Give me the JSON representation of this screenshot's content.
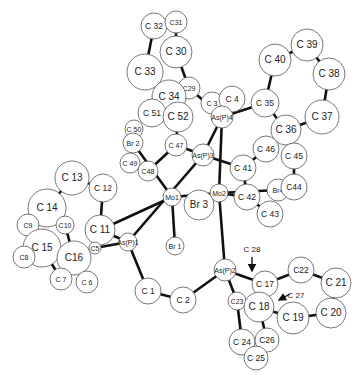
{
  "figure": {
    "type": "ORTEP molecular structure",
    "background": "#ffffff",
    "line_color": "#111111"
  },
  "atoms": [
    {
      "id": "C32",
      "label": "C 32",
      "x": 154,
      "y": 26,
      "r": 13
    },
    {
      "id": "C31",
      "label": "C31",
      "x": 176,
      "y": 22,
      "r": 11
    },
    {
      "id": "C30",
      "label": "C 30",
      "x": 176,
      "y": 52,
      "r": 16
    },
    {
      "id": "C33",
      "label": "C 33",
      "x": 145,
      "y": 72,
      "r": 18
    },
    {
      "id": "C29",
      "label": "C29",
      "x": 189,
      "y": 88,
      "r": 11
    },
    {
      "id": "C34",
      "label": "C 34",
      "x": 169,
      "y": 97,
      "r": 17
    },
    {
      "id": "C51",
      "label": "C 51",
      "x": 152,
      "y": 113,
      "r": 14
    },
    {
      "id": "C52",
      "label": "C 52",
      "x": 178,
      "y": 117,
      "r": 15
    },
    {
      "id": "C3",
      "label": "C 3",
      "x": 212,
      "y": 103,
      "r": 11
    },
    {
      "id": "C4",
      "label": "C 4",
      "x": 232,
      "y": 99,
      "r": 13
    },
    {
      "id": "AsP4",
      "label": "As(P)4",
      "x": 222,
      "y": 117,
      "r": 11
    },
    {
      "id": "C35",
      "label": "C 35",
      "x": 265,
      "y": 103,
      "r": 14
    },
    {
      "id": "C40",
      "label": "C 40",
      "x": 275,
      "y": 60,
      "r": 16
    },
    {
      "id": "C39",
      "label": "C 39",
      "x": 307,
      "y": 45,
      "r": 16
    },
    {
      "id": "C38",
      "label": "C 38",
      "x": 329,
      "y": 74,
      "r": 16
    },
    {
      "id": "C37",
      "label": "C 37",
      "x": 322,
      "y": 117,
      "r": 17
    },
    {
      "id": "C36",
      "label": "C 36",
      "x": 286,
      "y": 130,
      "r": 15
    },
    {
      "id": "C50",
      "label": "C 50",
      "x": 134,
      "y": 129,
      "r": 9
    },
    {
      "id": "Br2",
      "label": "Br 2",
      "x": 133,
      "y": 143,
      "r": 10
    },
    {
      "id": "C47",
      "label": "C 47",
      "x": 176,
      "y": 145,
      "r": 11
    },
    {
      "id": "AsP3",
      "label": "As(P)3",
      "x": 203,
      "y": 155,
      "r": 11
    },
    {
      "id": "C46",
      "label": "C 46",
      "x": 266,
      "y": 149,
      "r": 13
    },
    {
      "id": "C45",
      "label": "C 45",
      "x": 294,
      "y": 156,
      "r": 13
    },
    {
      "id": "C41",
      "label": "C 41",
      "x": 243,
      "y": 168,
      "r": 13
    },
    {
      "id": "C49",
      "label": "C 49",
      "x": 130,
      "y": 163,
      "r": 10
    },
    {
      "id": "C48",
      "label": "C48",
      "x": 148,
      "y": 171,
      "r": 10
    },
    {
      "id": "Mo1",
      "label": "Mo1",
      "x": 172,
      "y": 197,
      "r": 9
    },
    {
      "id": "Mo2",
      "label": "Mo2",
      "x": 219,
      "y": 193,
      "r": 9
    },
    {
      "id": "Br3",
      "label": "Br 3",
      "x": 199,
      "y": 205,
      "r": 15
    },
    {
      "id": "C42",
      "label": "C 42",
      "x": 247,
      "y": 197,
      "r": 13
    },
    {
      "id": "Br4",
      "label": "Br4",
      "x": 278,
      "y": 190,
      "r": 11
    },
    {
      "id": "C44",
      "label": "C44",
      "x": 294,
      "y": 187,
      "r": 13
    },
    {
      "id": "C43",
      "label": "C 43",
      "x": 270,
      "y": 214,
      "r": 13
    },
    {
      "id": "C13",
      "label": "C 13",
      "x": 72,
      "y": 178,
      "r": 17
    },
    {
      "id": "C12",
      "label": "C 12",
      "x": 103,
      "y": 188,
      "r": 14
    },
    {
      "id": "C14",
      "label": "C 14",
      "x": 47,
      "y": 208,
      "r": 19
    },
    {
      "id": "C9",
      "label": "C9",
      "x": 28,
      "y": 225,
      "r": 11
    },
    {
      "id": "C10",
      "label": "C10",
      "x": 65,
      "y": 225,
      "r": 9
    },
    {
      "id": "C11",
      "label": "C 11",
      "x": 100,
      "y": 230,
      "r": 15
    },
    {
      "id": "C15",
      "label": "C 15",
      "x": 42,
      "y": 248,
      "r": 19
    },
    {
      "id": "C5",
      "label": "C5",
      "x": 95,
      "y": 248,
      "r": 6
    },
    {
      "id": "AsP1",
      "label": "As(P)1",
      "x": 128,
      "y": 242,
      "r": 9
    },
    {
      "id": "C8",
      "label": "C8",
      "x": 24,
      "y": 257,
      "r": 11
    },
    {
      "id": "C16",
      "label": "C16",
      "x": 74,
      "y": 258,
      "r": 17
    },
    {
      "id": "C7",
      "label": "C 7",
      "x": 61,
      "y": 279,
      "r": 11
    },
    {
      "id": "C6",
      "label": "C 6",
      "x": 87,
      "y": 282,
      "r": 11
    },
    {
      "id": "Br1",
      "label": "Br 1",
      "x": 175,
      "y": 246,
      "r": 9
    },
    {
      "id": "C1",
      "label": "C 1",
      "x": 148,
      "y": 291,
      "r": 13
    },
    {
      "id": "C2",
      "label": "C 2",
      "x": 183,
      "y": 300,
      "r": 13
    },
    {
      "id": "AsP2",
      "label": "As(P)2",
      "x": 225,
      "y": 270,
      "r": 11
    },
    {
      "id": "C17",
      "label": "C 17",
      "x": 265,
      "y": 284,
      "r": 13
    },
    {
      "id": "C22",
      "label": "C22",
      "x": 301,
      "y": 270,
      "r": 13
    },
    {
      "id": "C21",
      "label": "C 21",
      "x": 336,
      "y": 283,
      "r": 15
    },
    {
      "id": "C23",
      "label": "C23",
      "x": 237,
      "y": 301,
      "r": 9
    },
    {
      "id": "C18",
      "label": "C 18",
      "x": 259,
      "y": 307,
      "r": 15
    },
    {
      "id": "C19",
      "label": "C 19",
      "x": 293,
      "y": 318,
      "r": 16
    },
    {
      "id": "C20",
      "label": "C 20",
      "x": 331,
      "y": 313,
      "r": 15
    },
    {
      "id": "C24",
      "label": "C 24",
      "x": 242,
      "y": 342,
      "r": 13
    },
    {
      "id": "C26",
      "label": "C26",
      "x": 267,
      "y": 340,
      "r": 12
    },
    {
      "id": "C25",
      "label": "C 25",
      "x": 256,
      "y": 358,
      "r": 12
    }
  ],
  "bonds": [
    [
      "C31",
      "C30"
    ],
    [
      "C32",
      "C33"
    ],
    [
      "C30",
      "C29"
    ],
    [
      "C33",
      "C34"
    ],
    [
      "C29",
      "C34"
    ],
    [
      "C29",
      "AsP4"
    ],
    [
      "C34",
      "C52"
    ],
    [
      "C52",
      "C47"
    ],
    [
      "C47",
      "C48"
    ],
    [
      "C47",
      "AsP3"
    ],
    [
      "C3",
      "AsP4"
    ],
    [
      "C4",
      "AsP4"
    ],
    [
      "AsP4",
      "C35"
    ],
    [
      "C35",
      "C40"
    ],
    [
      "C40",
      "C39"
    ],
    [
      "C39",
      "C38"
    ],
    [
      "C38",
      "C37"
    ],
    [
      "C37",
      "C36"
    ],
    [
      "C35",
      "C36"
    ],
    [
      "C36",
      "C45"
    ],
    [
      "C46",
      "C41"
    ],
    [
      "C45",
      "C44"
    ],
    [
      "AsP4",
      "AsP3"
    ],
    [
      "AsP4",
      "Mo2"
    ],
    [
      "AsP3",
      "C41"
    ],
    [
      "AsP3",
      "AsP1"
    ],
    [
      "Br2",
      "Mo1"
    ],
    [
      "Mo1",
      "Mo2"
    ],
    [
      "Mo1",
      "Br1"
    ],
    [
      "Mo1",
      "C11"
    ],
    [
      "Mo2",
      "C42"
    ],
    [
      "C42",
      "C41"
    ],
    [
      "Mo2",
      "Br4"
    ],
    [
      "C42",
      "C43"
    ],
    [
      "Mo2",
      "AsP2"
    ],
    [
      "C13",
      "C14"
    ],
    [
      "C13",
      "C12"
    ],
    [
      "C12",
      "C11"
    ],
    [
      "C10",
      "C16"
    ],
    [
      "C11",
      "AsP1"
    ],
    [
      "C5",
      "AsP1"
    ],
    [
      "C15",
      "C7"
    ],
    [
      "C16",
      "C6"
    ],
    [
      "AsP1",
      "C1"
    ],
    [
      "C1",
      "C2"
    ],
    [
      "C2",
      "AsP2"
    ],
    [
      "AsP2",
      "C17"
    ],
    [
      "AsP2",
      "C23"
    ],
    [
      "C17",
      "C22"
    ],
    [
      "C22",
      "C21"
    ],
    [
      "C21",
      "C20"
    ],
    [
      "C20",
      "C19"
    ],
    [
      "C19",
      "C18"
    ],
    [
      "C18",
      "C17"
    ],
    [
      "C23",
      "C24"
    ],
    [
      "C18",
      "C26"
    ]
  ],
  "annotations": [
    {
      "label": "C 28",
      "text_x": 252,
      "text_y": 252,
      "arrow_from": [
        252,
        257
      ],
      "arrow_to": [
        252,
        271
      ]
    },
    {
      "label": "C 27",
      "text_x": 296,
      "text_y": 298,
      "arrow_from": [
        290,
        294
      ],
      "arrow_to": [
        279,
        300
      ]
    }
  ]
}
